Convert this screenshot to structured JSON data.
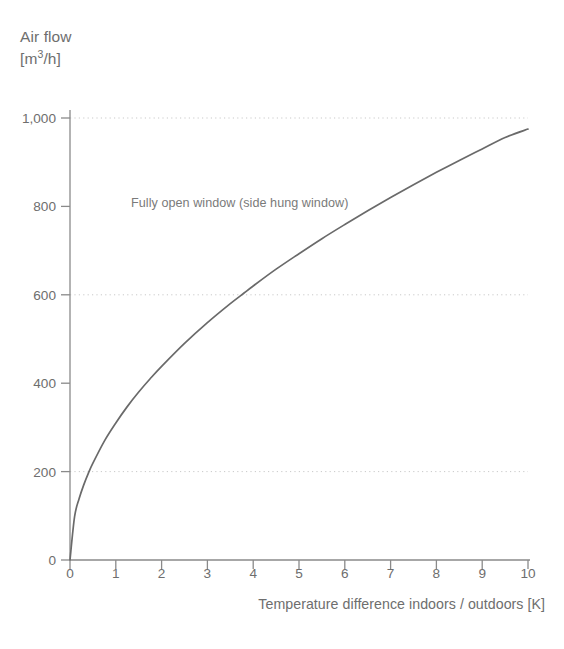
{
  "chart_data": {
    "type": "line",
    "title": "",
    "ylabel_line1": "Air flow",
    "ylabel_line2_prefix": "[m",
    "ylabel_line2_sup": "3",
    "ylabel_line2_suffix": "/h]",
    "xlabel": "Temperature difference indoors / outdoors [K]",
    "annotation": "Fully open window (side hung window)",
    "xlim": [
      0,
      10
    ],
    "ylim": [
      0,
      1000
    ],
    "grid": "horizontal-dotted",
    "legend": "none",
    "series_color": "#6a6a6a",
    "axis_color": "#8a8a8a",
    "grid_color": "#c9c9c9",
    "text_color": "#6e6e6e",
    "xticks": [
      0,
      1,
      2,
      3,
      4,
      5,
      6,
      7,
      8,
      9,
      10
    ],
    "xtick_labels": [
      "0",
      "1",
      "2",
      "3",
      "4",
      "5",
      "6",
      "7",
      "8",
      "9",
      "10"
    ],
    "yticks": [
      0,
      200,
      400,
      600,
      800,
      1000
    ],
    "ytick_labels": [
      "0",
      "200",
      "400",
      "600",
      "800",
      "1,000"
    ],
    "gridlines_at": [
      200,
      600,
      1000
    ],
    "series": [
      {
        "name": "Fully open window (side hung window)",
        "x": [
          0,
          0.1,
          0.2,
          0.3,
          0.4,
          0.5,
          0.75,
          1,
          1.25,
          1.5,
          1.75,
          2,
          2.5,
          3,
          3.5,
          3.8,
          4,
          4.5,
          5,
          5.5,
          6,
          6.5,
          7,
          7.5,
          8,
          8.5,
          9,
          9.5,
          10
        ],
        "values": [
          0,
          98,
          139,
          170,
          196,
          219,
          269,
          310,
          347,
          380,
          410,
          438,
          490,
          537,
          580,
          604,
          620,
          658,
          693,
          727,
          759,
          790,
          820,
          849,
          877,
          904,
          930,
          956,
          975
        ]
      }
    ]
  }
}
